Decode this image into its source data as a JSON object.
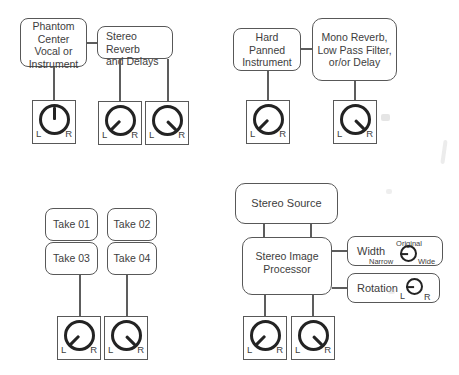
{
  "colors": {
    "ink": "#3d3d3d",
    "line": "#5d5d5d",
    "knob": "#232323",
    "background": "#ffffff"
  },
  "boxes": {
    "phantom_center": {
      "l1": "Phantom",
      "l2": "Center",
      "l3": "Vocal or",
      "l4": "Instrument"
    },
    "stereo_reverb": {
      "l1": "Stereo Reverb",
      "l2": "and Delays"
    },
    "hard_panned": {
      "l1": "Hard",
      "l2": "Panned",
      "l3": "Instrument"
    },
    "mono_reverb": {
      "l1": "Mono Reverb,",
      "l2": "Low Pass Filter,",
      "l3": "or/or Delay"
    },
    "take_01": "Take 01",
    "take_02": "Take 02",
    "take_03": "Take 03",
    "take_04": "Take 04",
    "stereo_source": "Stereo Source",
    "stereo_image_processor": {
      "l1": "Stereo Image",
      "l2": "Processor"
    }
  },
  "width_control": {
    "label": "Width",
    "top": "Original",
    "left": "Narrow",
    "right": "Wide"
  },
  "rotation_control": {
    "label": "Rotation",
    "left": "L",
    "right": "R"
  },
  "pan_knob_labels": {
    "left": "L",
    "right": "R"
  },
  "knob_values": {
    "phantom_pan": "center",
    "reverb_send_left": "hard-left",
    "reverb_send_right": "hard-right",
    "hard_panned_pan": "hard-left",
    "mono_effect_pan": "hard-right",
    "takes_pan_left": "hard-left",
    "takes_pan_right": "hard-right",
    "processor_out_left": "hard-left",
    "processor_out_right": "hard-right",
    "width": "left",
    "rotation": "left"
  }
}
